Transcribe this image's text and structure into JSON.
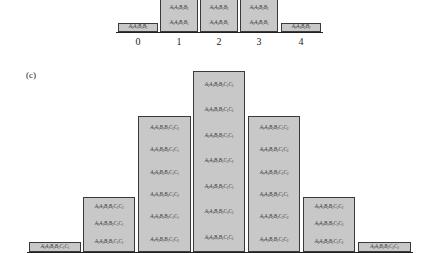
{
  "panel_b": {
    "tick_labels": [
      "0",
      "1",
      "2",
      "3",
      "4"
    ],
    "bars": [
      {
        "cells": [
          "A1A1B1B1"
        ]
      },
      {
        "cells": [
          "A1A1B2B2",
          "A1A2B1B1"
        ]
      },
      {
        "cells": [
          "A1A2B1B2",
          "A1A2B1B1"
        ]
      },
      {
        "cells": [
          "A1A2B2B2",
          "A2A2B1B1"
        ]
      },
      {
        "cells": [
          "A2A2B2B2"
        ]
      }
    ]
  },
  "panel_c": {
    "label": "(c)",
    "bars": [
      {
        "cells": [
          "A1A1B1B1C1C1"
        ]
      },
      {
        "cells": [
          "A1A1B1B1C1C2",
          "A1A1B1B2C1C1",
          "A1A2B1B1C1C1"
        ]
      },
      {
        "cells": [
          "A1A1B1B1C2C2",
          "A1A1B2B2C1C1",
          "A2A2B1B1C1C1",
          "A1A1B1B2C1C2",
          "A1A2B1B2C1C1",
          "A1A2B1B1C1C2"
        ]
      },
      {
        "cells": [
          "A1A1B2B2C1C2",
          "A1A2B1B2C1C2",
          "A1A2B2B2C1C1",
          "A1A2B1B1C2C2",
          "A2A2B1B2C1C1",
          "A1A1B1B2C2C2",
          "A2A2B1B1C1C2"
        ]
      },
      {
        "cells": [
          "A1A2B2B2C1C2",
          "A2A2B1B2C1C2",
          "A1A2B1B2C2C2",
          "A2A2B2B2C1C1",
          "A1A1B2B2C2C2",
          "A2A2B1B1C2C2"
        ]
      },
      {
        "cells": [
          "A1A2B2B2C2C2",
          "A2A2B1B2C2C2",
          "A2A2B2B2C1C2"
        ]
      },
      {
        "cells": [
          "A2A2B2B2C2C2"
        ]
      }
    ]
  }
}
